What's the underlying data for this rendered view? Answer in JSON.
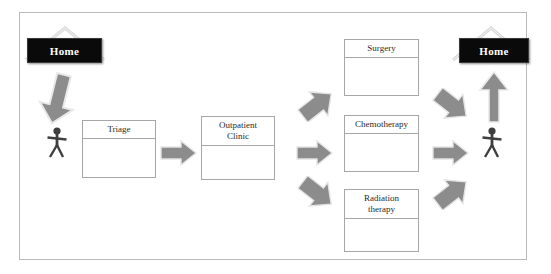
{
  "diagram": {
    "colors": {
      "arrow_fill": "#8c8c8c",
      "arrow_stroke": "#6f6f6f",
      "box_border": "#a6a6a6",
      "frame_border": "#b9b9b9",
      "sign_background": "#0a0a0a",
      "sign_text": "#ffffff",
      "figure_fill": "#3f3f3f",
      "background": "#ffffff"
    }
  },
  "signs": [
    {
      "id": "home-start",
      "label": "Home"
    },
    {
      "id": "home-end",
      "label": "Home"
    }
  ],
  "boxes": [
    {
      "id": "triage",
      "label": "Triage"
    },
    {
      "id": "outpatient",
      "label": "Outpatient\nClinic"
    },
    {
      "id": "surgery",
      "label": "Surgery"
    },
    {
      "id": "chemo",
      "label": "Chemotherapy"
    },
    {
      "id": "radiation",
      "label": "Radiation\ntherapy"
    }
  ],
  "figures": [
    {
      "id": "patient-start",
      "name": "stick-figure"
    },
    {
      "id": "patient-end",
      "name": "stick-figure"
    }
  ],
  "arrows": [
    {
      "id": "home-to-patient",
      "direction": "down"
    },
    {
      "id": "patient-to-triage",
      "direction": "right"
    },
    {
      "id": "triage-to-outpatient",
      "direction": "right"
    },
    {
      "id": "outpatient-to-surgery",
      "direction": "up-right"
    },
    {
      "id": "outpatient-to-chemo",
      "direction": "right"
    },
    {
      "id": "outpatient-to-radiation",
      "direction": "down-right"
    },
    {
      "id": "surgery-to-patient",
      "direction": "down-right"
    },
    {
      "id": "chemo-to-patient",
      "direction": "right"
    },
    {
      "id": "radiation-to-patient",
      "direction": "up-right"
    },
    {
      "id": "patient-to-home",
      "direction": "up"
    }
  ]
}
